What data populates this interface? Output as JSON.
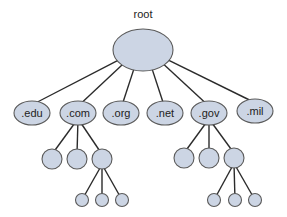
{
  "diagram": {
    "colors": {
      "node_fill": "#ccd5e4",
      "node_stroke": "#5a5a5a",
      "edge": "#2b2b2b",
      "background": "#ffffff"
    },
    "root": {
      "label": "root",
      "cx": 143,
      "cy": 50,
      "rx": 30,
      "ry": 21,
      "label_y": 18
    },
    "tlds": [
      {
        "label": ".edu",
        "cx": 32,
        "cy": 113,
        "rx": 18,
        "ry": 12
      },
      {
        "label": ".com",
        "cx": 78,
        "cy": 113,
        "rx": 18,
        "ry": 12
      },
      {
        "label": ".org",
        "cx": 121,
        "cy": 113,
        "rx": 18,
        "ry": 12
      },
      {
        "label": ".net",
        "cx": 165,
        "cy": 113,
        "rx": 18,
        "ry": 12
      },
      {
        "label": ".gov",
        "cx": 209,
        "cy": 113,
        "rx": 18,
        "ry": 12
      },
      {
        "label": ".mil",
        "cx": 255,
        "cy": 111,
        "rx": 18,
        "ry": 12
      }
    ],
    "subtrees": [
      {
        "parent": ".com",
        "level3": [
          {
            "cx": 52,
            "cy": 159,
            "r": 10
          },
          {
            "cx": 77,
            "cy": 159,
            "r": 10
          },
          {
            "cx": 102,
            "cy": 159,
            "r": 10
          }
        ],
        "expanded_index": 2,
        "level4": [
          {
            "cx": 82,
            "cy": 200,
            "r": 6.5
          },
          {
            "cx": 102,
            "cy": 200,
            "r": 6.5
          },
          {
            "cx": 122,
            "cy": 200,
            "r": 6.5
          }
        ]
      },
      {
        "parent": ".gov",
        "level3": [
          {
            "cx": 184,
            "cy": 158,
            "r": 10
          },
          {
            "cx": 209,
            "cy": 158,
            "r": 10
          },
          {
            "cx": 234,
            "cy": 158,
            "r": 10
          }
        ],
        "expanded_index": 2,
        "level4": [
          {
            "cx": 214,
            "cy": 200,
            "r": 6.5
          },
          {
            "cx": 235,
            "cy": 200,
            "r": 6.5
          },
          {
            "cx": 255,
            "cy": 200,
            "r": 6.5
          }
        ]
      }
    ]
  }
}
